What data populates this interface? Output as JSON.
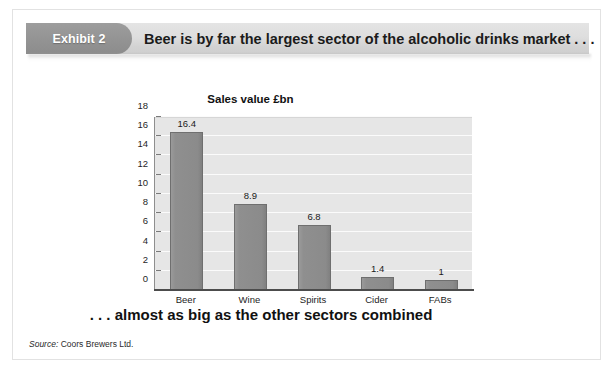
{
  "exhibit": {
    "badge_label": "Exhibit 2",
    "headline": "Beer is by far the largest sector of the alcoholic drinks market . . .",
    "caption": ". . . almost as big as the other sectors combined",
    "source_label": "Source:",
    "source_text": "Coors Brewers Ltd."
  },
  "colors": {
    "badge": "#949494",
    "banner": "#dedede",
    "bar": "#8b8b8b",
    "plot_background": "#e6e6e6",
    "gridline": "#fbfbfb",
    "axis": "#4c4c4c"
  },
  "chart_data": {
    "type": "bar",
    "title": "Sales value £bn",
    "xlabel": "",
    "ylabel": "",
    "categories": [
      "Beer",
      "Wine",
      "Spirits",
      "Cider",
      "FABs"
    ],
    "values": [
      16.4,
      8.9,
      6.8,
      1.4,
      1
    ],
    "value_labels": [
      "16.4",
      "8.9",
      "6.8",
      "1.4",
      "1"
    ],
    "ylim": [
      0,
      18
    ],
    "yticks": [
      0,
      2,
      4,
      6,
      8,
      10,
      12,
      14,
      16,
      18
    ],
    "ytick_labels": [
      "0",
      "2",
      "4",
      "6",
      "8",
      "10",
      "12",
      "14",
      "16",
      "18"
    ],
    "grid": true,
    "legend": false,
    "legend_position": "none"
  }
}
